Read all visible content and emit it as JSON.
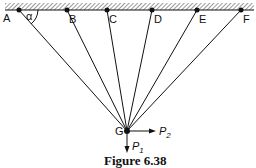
{
  "figure": {
    "caption": "Figure 6.38",
    "ceiling_points": [
      {
        "label": "A",
        "x": 19
      },
      {
        "label": "B",
        "x": 67
      },
      {
        "label": "C",
        "x": 107
      },
      {
        "label": "D",
        "x": 152
      },
      {
        "label": "E",
        "x": 197
      },
      {
        "label": "F",
        "x": 241
      }
    ],
    "joint": {
      "label": "G"
    },
    "angle_label": "α",
    "forces": [
      {
        "name": "P",
        "subscript": "1",
        "direction": "down"
      },
      {
        "name": "P",
        "subscript": "2",
        "direction": "right"
      }
    ]
  }
}
